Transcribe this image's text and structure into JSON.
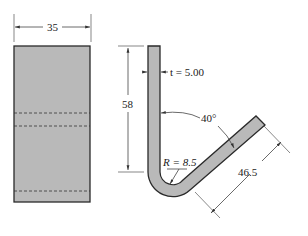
{
  "diagram": {
    "type": "engineering drawing - bent sheet metal hook bracket",
    "front_view": {
      "width_label": "35",
      "hidden_lines": 3
    },
    "side_view": {
      "thickness_label": "t = 5.00",
      "height_label": "58",
      "angle_label": "40°",
      "radius_label": "R = 8.5",
      "leg_length_label": "46.5"
    },
    "colors": {
      "part_fill": "#b9b9b9",
      "outline": "#2a2a2a"
    }
  }
}
